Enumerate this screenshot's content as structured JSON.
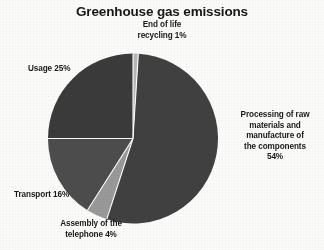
{
  "chart_data": {
    "type": "pie",
    "title": "Greenhouse gas emissions",
    "xlabel": "",
    "ylabel": "",
    "legend_position": "none",
    "grid": false,
    "units": "%",
    "total": 100,
    "start_angle_deg": 0,
    "direction": "clockwise",
    "categories": [
      "End of life recycling",
      "Processing of raw materials and manufacture of the components",
      "Assembly of the telephone",
      "Transport",
      "Usage"
    ],
    "values": [
      1,
      54,
      4,
      16,
      25
    ],
    "slices": [
      {
        "name": "end-of-life-recycling",
        "label": "End of life\nrecycling 1%",
        "label_text": "End of life recycling",
        "value": 1,
        "value_text": "1%",
        "color": "#b9b9b9",
        "start_deg": 0,
        "end_deg": 3.6
      },
      {
        "name": "processing-raw-materials",
        "label": "Processing of raw\nmaterials and\nmanufacture of\nthe components\n54%",
        "label_text": "Processing of raw materials and manufacture of the components",
        "value": 54,
        "value_text": "54%",
        "color": "#414141",
        "start_deg": 3.6,
        "end_deg": 198
      },
      {
        "name": "assembly-of-telephone",
        "label": "Assembly of the\ntelephone 4%",
        "label_text": "Assembly of the telephone",
        "value": 4,
        "value_text": "4%",
        "color": "#9a9a9a",
        "start_deg": 198,
        "end_deg": 212.4
      },
      {
        "name": "transport",
        "label": "Transport 16%",
        "label_text": "Transport",
        "value": 16,
        "value_text": "16%",
        "color": "#4d4d4d",
        "start_deg": 212.4,
        "end_deg": 270
      },
      {
        "name": "usage",
        "label": "Usage 25%",
        "label_text": "Usage",
        "value": 25,
        "value_text": "25%",
        "color": "#3b3b3b",
        "start_deg": 270,
        "end_deg": 360
      }
    ],
    "geometry": {
      "center_x": 85,
      "center_y": 85.5,
      "radius": 85,
      "separator_color": "#ffffff",
      "separator_width": 1.1
    },
    "background_color": "#fdfdfc",
    "text_color": "#1a1a1a"
  }
}
